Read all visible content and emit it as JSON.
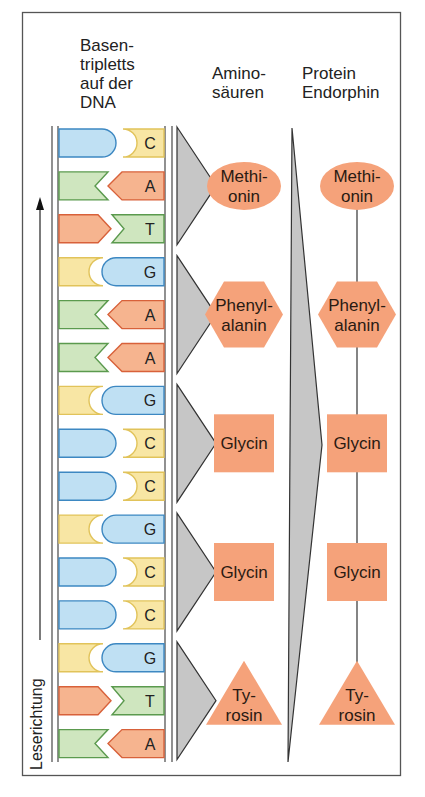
{
  "headers": {
    "dna": "Basen-\ntripletts\nauf der\nDNA",
    "amino": "Amino-\nsäuren",
    "protein": "Protein\nEndorphin"
  },
  "reading_direction": "Leserichtung",
  "colors": {
    "A_fill": "#f6b48f",
    "A_stroke": "#d8613a",
    "T_fill": "#cfe6bf",
    "T_stroke": "#5b9a4e",
    "G_fill": "#bfe0f3",
    "G_stroke": "#3d88c2",
    "C_fill": "#f8e6a4",
    "C_stroke": "#e1c35a",
    "amino_fill": "#f5a27a",
    "arrow_fill": "#c6c6c6",
    "line": "#333333"
  },
  "dna_bases": [
    "C",
    "A",
    "T",
    "G",
    "A",
    "A",
    "G",
    "C",
    "C",
    "G",
    "C",
    "C",
    "G",
    "T",
    "A"
  ],
  "amino_acids": [
    {
      "label": "Methi-\nonin",
      "shape": "ellipse"
    },
    {
      "label": "Phenyl-\nalanin",
      "shape": "hexagon"
    },
    {
      "label": "Glycin",
      "shape": "square"
    },
    {
      "label": "Glycin",
      "shape": "square"
    },
    {
      "label": "Ty-\nrosin",
      "shape": "triangle"
    }
  ]
}
